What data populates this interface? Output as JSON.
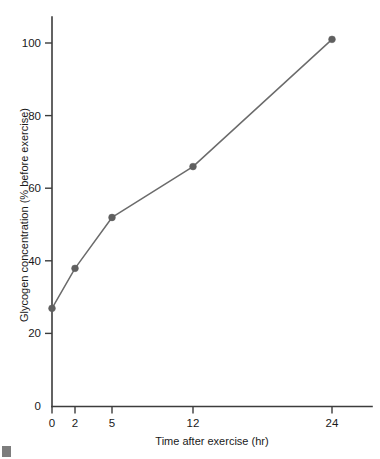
{
  "chart_data": {
    "type": "line",
    "title": "",
    "xlabel": "Time after exercise (hr)",
    "ylabel": "Glycogen concentration (% before exercise)",
    "x": [
      0,
      2,
      5,
      12,
      24
    ],
    "values": [
      27,
      38,
      52,
      66,
      101
    ],
    "x_tick_labels": [
      "0",
      "2",
      "5",
      "12",
      "24"
    ],
    "y_tick_labels": [
      "0",
      "20",
      "40",
      "60",
      "80",
      "100"
    ],
    "y_ticks": [
      0,
      20,
      40,
      60,
      80,
      100
    ],
    "ylim": [
      0,
      110
    ],
    "grid": false,
    "legend": false,
    "legend_position": "none",
    "series": [
      {
        "name": "Glycogen concentration",
        "values": [
          27,
          38,
          52,
          66,
          101
        ],
        "color": "#6b6b6b",
        "marker": "circle"
      }
    ],
    "axis_scale_note": "x axis uses non-linear category-like spacing",
    "colors": {
      "line": "#6b6b6b",
      "marker": "#5f5f5f",
      "axis": "#3c3c3c",
      "text": "#1a1a1a",
      "background": "#ffffff"
    }
  },
  "axes": {
    "y_title": "Glycogen concentration (% before exercise)",
    "x_title": "Time after exercise (hr)"
  },
  "ticks": {
    "y": [
      {
        "label": "100"
      },
      {
        "label": "80"
      },
      {
        "label": "60"
      },
      {
        "label": "40"
      },
      {
        "label": "20"
      },
      {
        "label": "0"
      }
    ],
    "x": [
      {
        "label": "0"
      },
      {
        "label": "2"
      },
      {
        "label": "5"
      },
      {
        "label": "12"
      },
      {
        "label": "24"
      }
    ]
  }
}
